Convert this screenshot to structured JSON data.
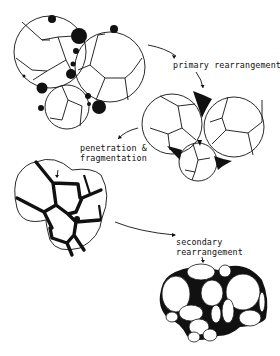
{
  "diagram": {
    "type": "process-flow",
    "stages": [
      {
        "id": "stage-1",
        "description": "three polyhedral droplets with dispersed black particles at junctions"
      },
      {
        "id": "stage-2",
        "description": "three droplets in contact with black plateau-border junctions"
      },
      {
        "id": "stage-3",
        "description": "droplets fragmented into smaller cells with thick black boundaries"
      },
      {
        "id": "stage-4",
        "description": "rearranged cluster of rounded cells with black interstitial regions"
      }
    ],
    "labels": {
      "primary": "primary rearrangement",
      "penetration_line1": "penetration &",
      "penetration_line2": "fragmentation",
      "secondary_line1": "secondary",
      "secondary_line2": "rearrangement"
    },
    "colors": {
      "ink": "#111111",
      "background": "#ffffff"
    }
  }
}
